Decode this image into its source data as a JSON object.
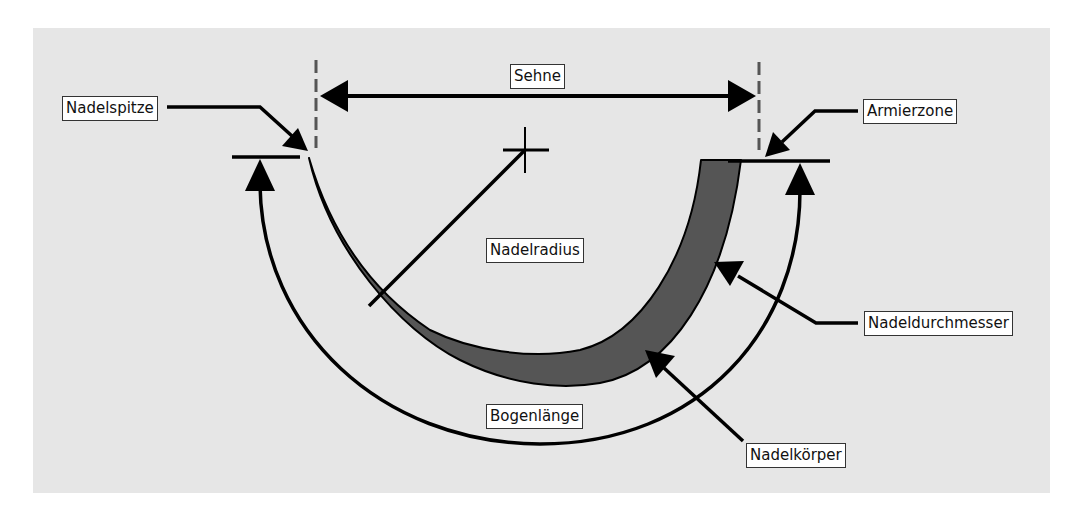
{
  "diagram": {
    "colors": {
      "background": "#ffffff",
      "panel": "#e6e6e6",
      "needle_fill": "#555555",
      "outline": "#000000",
      "dashed_line": "#555555",
      "label_bg": "#ffffff",
      "label_border": "#333333"
    },
    "labels": {
      "sehne": "Sehne",
      "nadelspitze": "Nadelspitze",
      "armierzone": "Armierzone",
      "nadelradius": "Nadelradius",
      "nadeldurchmesser": "Nadeldurchmesser",
      "bogenlaenge": "Bogenlänge",
      "nadelkoerper": "Nadelkörper"
    }
  }
}
